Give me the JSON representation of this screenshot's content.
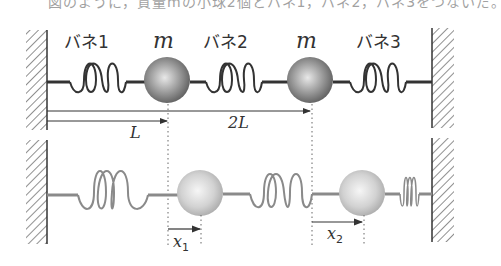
{
  "header": {
    "cut_text": "図のように，質量mの小球2個とバネ1，バネ2，バネ3をつないだ。"
  },
  "top_diagram": {
    "spring_labels": [
      "バネ1",
      "バネ2",
      "バネ3"
    ],
    "mass_labels": [
      "m",
      "m"
    ],
    "distance_labels": {
      "first": "L",
      "second": "2L"
    }
  },
  "bottom_diagram": {
    "displacement_labels": {
      "first": "x",
      "first_sub": "1",
      "second": "x",
      "second_sub": "2"
    }
  },
  "colors": {
    "dark_line": "#333333",
    "gray_line": "#8a8a8a",
    "ball_top_dark": "#6e6e6e",
    "ball_bottom_light": "#bdbdbd"
  }
}
